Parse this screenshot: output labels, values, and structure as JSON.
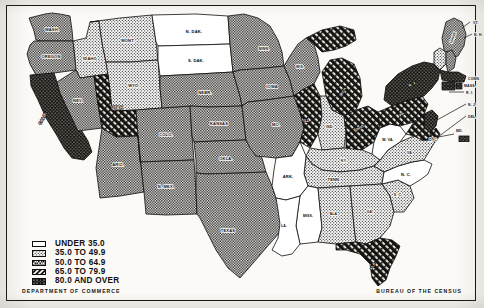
{
  "map": {
    "title": "",
    "frame": true,
    "classes": [
      {
        "id": "c1",
        "label": "UNDER 35.0",
        "pattern": "solid-white",
        "fill": "#ffffff",
        "range": [
          0,
          35.0
        ]
      },
      {
        "id": "c2",
        "label": "35.0 TO 49.9",
        "pattern": "fine-dot",
        "fill": "#d8d5ce",
        "range": [
          35.0,
          49.9
        ]
      },
      {
        "id": "c3",
        "label": "50.0 TO 64.9",
        "pattern": "checker",
        "fill": "#8d8a84",
        "range": [
          50.0,
          64.9
        ]
      },
      {
        "id": "c4",
        "label": "65.0 TO 79.9",
        "pattern": "diagonal-hatch",
        "fill": "#3b3935",
        "range": [
          65.0,
          79.9
        ]
      },
      {
        "id": "c5",
        "label": "80.0 AND OVER",
        "pattern": "solid-black-dot",
        "fill": "#16140f",
        "range": [
          80.0,
          100.0
        ]
      }
    ],
    "states": [
      {
        "abbr": "WASH.",
        "label": "WASH.",
        "class": "c3"
      },
      {
        "abbr": "OREGON",
        "label": "OREGON",
        "class": "c3"
      },
      {
        "abbr": "CALIF.",
        "label": "CALIF.",
        "class": "c5"
      },
      {
        "abbr": "IDAHO",
        "label": "IDAHO",
        "class": "c2"
      },
      {
        "abbr": "NEV.",
        "label": "NEV.",
        "class": "c3"
      },
      {
        "abbr": "MONT.",
        "label": "MONT.",
        "class": "c2"
      },
      {
        "abbr": "WYO.",
        "label": "WYO.",
        "class": "c2"
      },
      {
        "abbr": "UTAH",
        "label": "UTAH",
        "class": "c4"
      },
      {
        "abbr": "ARIZ.",
        "label": "ARIZ.",
        "class": "c3"
      },
      {
        "abbr": "COLO.",
        "label": "COLO.",
        "class": "c3"
      },
      {
        "abbr": "N.MEX.",
        "label": "N. MEX.",
        "class": "c3"
      },
      {
        "abbr": "N.DAK.",
        "label": "N. DAK.",
        "class": "c1"
      },
      {
        "abbr": "S.DAK.",
        "label": "S. DAK.",
        "class": "c1"
      },
      {
        "abbr": "NEBR.",
        "label": "NEBR.",
        "class": "c3"
      },
      {
        "abbr": "KANSAS",
        "label": "KANSAS",
        "class": "c3"
      },
      {
        "abbr": "OKLA.",
        "label": "OKLA.",
        "class": "c3"
      },
      {
        "abbr": "TEXAS",
        "label": "TEXAS",
        "class": "c3"
      },
      {
        "abbr": "MINN.",
        "label": "MINN.",
        "class": "c3"
      },
      {
        "abbr": "IOWA",
        "label": "IOWA",
        "class": "c3"
      },
      {
        "abbr": "MO.",
        "label": "MO.",
        "class": "c3"
      },
      {
        "abbr": "ARK.",
        "label": "ARK.",
        "class": "c1"
      },
      {
        "abbr": "LA.",
        "label": "LA.",
        "class": "c1"
      },
      {
        "abbr": "MISS.",
        "label": "MISS.",
        "class": "c1"
      },
      {
        "abbr": "WIS.",
        "label": "WIS.",
        "class": "c3"
      },
      {
        "abbr": "ILL.",
        "label": "ILL.",
        "class": "c4"
      },
      {
        "abbr": "MICH.",
        "label": "MICH.",
        "class": "c4"
      },
      {
        "abbr": "IND.",
        "label": "IND.",
        "class": "c2"
      },
      {
        "abbr": "OHIO",
        "label": "OHIO",
        "class": "c4"
      },
      {
        "abbr": "KY.",
        "label": "KY.",
        "class": "c2"
      },
      {
        "abbr": "TENN.",
        "label": "TENN.",
        "class": "c2"
      },
      {
        "abbr": "ALA.",
        "label": "ALA.",
        "class": "c2"
      },
      {
        "abbr": "GA.",
        "label": "GA.",
        "class": "c2"
      },
      {
        "abbr": "FLA.",
        "label": "FLA.",
        "class": "c4"
      },
      {
        "abbr": "S.C.",
        "label": "S. C.",
        "class": "c2"
      },
      {
        "abbr": "N.C.",
        "label": "N. C.",
        "class": "c1"
      },
      {
        "abbr": "VA.",
        "label": "VA.",
        "class": "c2"
      },
      {
        "abbr": "W.VA.",
        "label": "W. VA.",
        "class": "c1"
      },
      {
        "abbr": "PA.",
        "label": "PA.",
        "class": "c4"
      },
      {
        "abbr": "N.Y.",
        "label": "N. Y.",
        "class": "c5"
      },
      {
        "abbr": "MAINE",
        "label": "MAINE",
        "class": "c3"
      },
      {
        "abbr": "VT.",
        "label": "VT.",
        "class": "c2"
      },
      {
        "abbr": "N.H.",
        "label": "N. H.",
        "class": "c3"
      },
      {
        "abbr": "MASS.",
        "label": "MASS.",
        "class": "c5"
      },
      {
        "abbr": "R.I.",
        "label": "R. I.",
        "class": "c5"
      },
      {
        "abbr": "CONN.",
        "label": "CONN.",
        "class": "c5"
      },
      {
        "abbr": "N.J.",
        "label": "N. J.",
        "class": "c5"
      },
      {
        "abbr": "DEL.",
        "label": "DEL.",
        "class": "c4"
      },
      {
        "abbr": "MD.",
        "label": "MD.",
        "class": "c4"
      },
      {
        "abbr": "D.C.",
        "label": "D. C.",
        "class": "c5"
      }
    ]
  },
  "footer": {
    "left": "DEPARTMENT OF COMMERCE",
    "right": "BUREAU OF THE CENSUS"
  }
}
